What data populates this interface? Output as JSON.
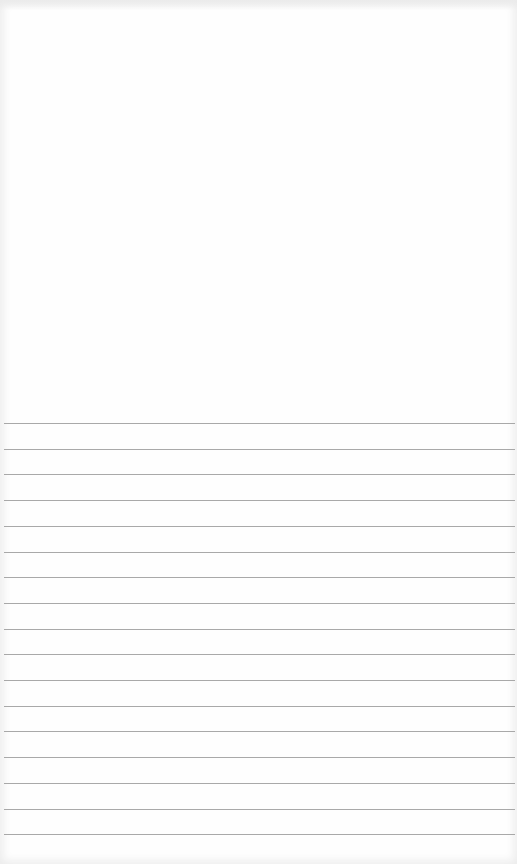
{
  "page": {
    "type": "blank ruled paper",
    "paper_color": "#fefefe",
    "line_color": "#9a9a9a",
    "ruled_lines": {
      "count": 17,
      "first_y": 423,
      "spacing": 25.7
    },
    "text_content": ""
  }
}
